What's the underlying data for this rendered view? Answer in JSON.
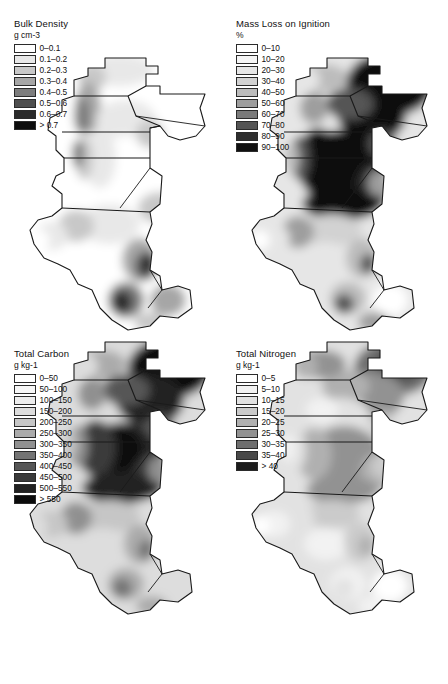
{
  "figure": {
    "panels": [
      {
        "id": "bulk-density",
        "title": "Bulk Density",
        "units": "g cm-3",
        "legend": [
          {
            "label": "0–0.1",
            "color": "#ffffff"
          },
          {
            "label": "0.1–0.2",
            "color": "#e8e8e8"
          },
          {
            "label": "0.2–0.3",
            "color": "#c8c8c8"
          },
          {
            "label": "0.3–0.4",
            "color": "#a6a6a6"
          },
          {
            "label": "0.4–0.5",
            "color": "#7d7d7d"
          },
          {
            "label": "0.5–0.6",
            "color": "#4f4f4f"
          },
          {
            "label": "0.6–0.7",
            "color": "#2a2a2a"
          },
          {
            "label": "> 0.7",
            "color": "#0d0d0d"
          }
        ]
      },
      {
        "id": "mass-loss",
        "title": "Mass Loss on Ignition",
        "units": "%",
        "legend": [
          {
            "label": "0–10",
            "color": "#ffffff"
          },
          {
            "label": "10–20",
            "color": "#f5f5f5"
          },
          {
            "label": "20–30",
            "color": "#e6e6e6"
          },
          {
            "label": "30–40",
            "color": "#d2d2d2"
          },
          {
            "label": "40–50",
            "color": "#bcbcbc"
          },
          {
            "label": "50–60",
            "color": "#9e9e9e"
          },
          {
            "label": "60–70",
            "color": "#7a7a7a"
          },
          {
            "label": "70–80",
            "color": "#545454"
          },
          {
            "label": "80–90",
            "color": "#2e2e2e"
          },
          {
            "label": "90–100",
            "color": "#101010"
          }
        ]
      },
      {
        "id": "total-carbon",
        "title": "Total Carbon",
        "units": "g kg-1",
        "legend": [
          {
            "label": "0–50",
            "color": "#ffffff"
          },
          {
            "label": "50–100",
            "color": "#f7f7f7"
          },
          {
            "label": "100–150",
            "color": "#ededed"
          },
          {
            "label": "150–200",
            "color": "#dddddd"
          },
          {
            "label": "200–250",
            "color": "#c6c6c6"
          },
          {
            "label": "250–300",
            "color": "#ababab"
          },
          {
            "label": "300–350",
            "color": "#909090"
          },
          {
            "label": "350–400",
            "color": "#747474"
          },
          {
            "label": "400–450",
            "color": "#565656"
          },
          {
            "label": "450–500",
            "color": "#3a3a3a"
          },
          {
            "label": "500–550",
            "color": "#212121"
          },
          {
            "label": "> 550",
            "color": "#0b0b0b"
          }
        ]
      },
      {
        "id": "total-nitrogen",
        "title": "Total Nitrogen",
        "units": "g kg-1",
        "legend": [
          {
            "label": "0–5",
            "color": "#ffffff"
          },
          {
            "label": "5–10",
            "color": "#f2f2f2"
          },
          {
            "label": "10–15",
            "color": "#e2e2e2"
          },
          {
            "label": "15–20",
            "color": "#cbcbcb"
          },
          {
            "label": "20–25",
            "color": "#b0b0b0"
          },
          {
            "label": "25–30",
            "color": "#929292"
          },
          {
            "label": "30–35",
            "color": "#6e6e6e"
          },
          {
            "label": "35–40",
            "color": "#484848"
          },
          {
            "label": "> 40",
            "color": "#1c1c1c"
          }
        ]
      }
    ]
  },
  "map_furniture": {
    "north_label": "N",
    "scalebar": {
      "ticks": [
        "0",
        "10",
        "20"
      ],
      "end_label": "40Km"
    }
  }
}
